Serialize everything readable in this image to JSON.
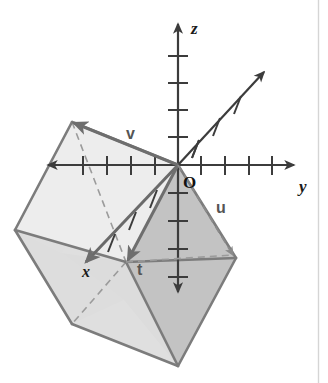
{
  "figure": {
    "background_color": "#ffffff",
    "width": 328,
    "height": 383,
    "rule_color": "#d5d5d5"
  },
  "axes": {
    "origin_label": "O",
    "origin_point": [
      178,
      165
    ],
    "items": [
      {
        "name": "z-axis",
        "label": "z",
        "label_pos": [
          193,
          30
        ],
        "direction": "vertical",
        "positive_end": [
          178,
          22
        ],
        "negative_end": [
          178,
          292
        ],
        "tick_count_positive": 4,
        "tick_count_negative": 4,
        "color": "#3c3c3c"
      },
      {
        "name": "y-axis",
        "label": "y",
        "label_pos": [
          300,
          190
        ],
        "direction": "horizontal",
        "positive_end": [
          296,
          165
        ],
        "negative_end": [
          48,
          165
        ],
        "tick_count_positive": 4,
        "tick_count_negative": 4,
        "color": "#3c3c3c"
      },
      {
        "name": "x-axis",
        "label": "x",
        "label_pos": [
          88,
          272
        ],
        "direction": "diagonal",
        "positive_end": [
          84,
          262
        ],
        "negative_end": [
          266,
          70
        ],
        "tick_count_positive": 4,
        "tick_count_negative": 4,
        "color": "#3c3c3c"
      }
    ]
  },
  "vectors": [
    {
      "name": "vector-v",
      "label": "v",
      "label_pos": [
        131,
        134
      ],
      "from": [
        178,
        165
      ],
      "to": [
        72,
        122
      ],
      "style": "solid",
      "color": "#6e6e6e"
    },
    {
      "name": "vector-t",
      "label": "t",
      "label_pos": [
        140,
        270
      ],
      "from": [
        178,
        165
      ],
      "to": [
        126,
        262
      ],
      "style": "solid",
      "color": "#6e6e6e"
    },
    {
      "name": "vector-u",
      "label": "u",
      "label_pos": [
        220,
        208
      ],
      "from": [
        178,
        165
      ],
      "to": [
        236,
        258
      ],
      "style": "dashed",
      "color": "#8a8a8a"
    }
  ],
  "solid": {
    "name": "rhombic-solid",
    "faces": [
      {
        "name": "face-top-left",
        "fill": "#f1f1f1",
        "points": "72,122 15,230 62,253 124,148"
      },
      {
        "name": "face-left",
        "fill": "#e9e9e9",
        "points": "15,230 72,324 124,300 62,253"
      },
      {
        "name": "face-front-lower",
        "fill": "#dcdcdc",
        "points": "62,253 124,300 178,366 126,262"
      },
      {
        "name": "face-front-right",
        "fill": "#c6c6c6",
        "points": "126,262 178,366 236,258 178,165"
      },
      {
        "name": "face-right-upper",
        "fill": "#b9b9b9",
        "points": "178,165 236,258 178,366"
      }
    ],
    "edges": [
      {
        "name": "edge-1",
        "from": [
          72,
          122
        ],
        "to": [
          15,
          230
        ],
        "style": "solid"
      },
      {
        "name": "edge-2",
        "from": [
          15,
          230
        ],
        "to": [
          72,
          324
        ],
        "style": "solid"
      },
      {
        "name": "edge-3",
        "from": [
          72,
          324
        ],
        "to": [
          178,
          366
        ],
        "style": "solid"
      },
      {
        "name": "edge-4",
        "from": [
          178,
          366
        ],
        "to": [
          236,
          258
        ],
        "style": "solid"
      },
      {
        "name": "edge-5",
        "from": [
          236,
          258
        ],
        "to": [
          178,
          165
        ],
        "style": "solid"
      },
      {
        "name": "edge-6",
        "from": [
          178,
          165
        ],
        "to": [
          72,
          122
        ],
        "style": "solid"
      },
      {
        "name": "edge-7",
        "from": [
          15,
          230
        ],
        "to": [
          126,
          262
        ],
        "style": "solid"
      },
      {
        "name": "edge-8",
        "from": [
          126,
          262
        ],
        "to": [
          236,
          258
        ],
        "style": "solid"
      },
      {
        "name": "edge-9",
        "from": [
          126,
          262
        ],
        "to": [
          178,
          366
        ],
        "style": "solid"
      },
      {
        "name": "edge-10",
        "from": [
          72,
          122
        ],
        "to": [
          126,
          262
        ],
        "style": "dashed"
      },
      {
        "name": "edge-11",
        "from": [
          126,
          262
        ],
        "to": [
          72,
          324
        ],
        "style": "dashed"
      }
    ],
    "edge_color": "#7c7c7c",
    "dashed_color": "#9b9b9b"
  }
}
